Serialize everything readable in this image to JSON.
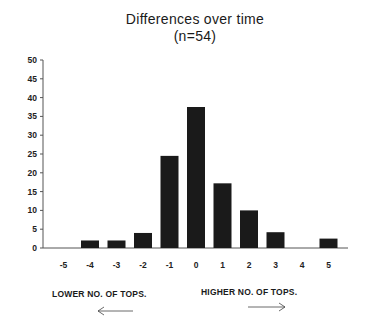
{
  "chart_data": {
    "type": "bar",
    "title": "Differences over time",
    "subtitle": "(n=54)",
    "xlabel": "",
    "ylabel": "",
    "categories": [
      "-5",
      "-4",
      "-3",
      "-2",
      "-1",
      "0",
      "1",
      "2",
      "3",
      "4",
      "5"
    ],
    "values": [
      0,
      2,
      2,
      4,
      24.5,
      37.5,
      17.2,
      10,
      4.2,
      0,
      2.5
    ],
    "ylim": [
      0,
      50
    ],
    "yticks": [
      0,
      5,
      10,
      15,
      20,
      25,
      30,
      35,
      40,
      45,
      50
    ],
    "grid": false,
    "legend": null,
    "bar_color": "#1a1a1a",
    "annotations": [
      {
        "text": "LOWER NO. OF TOPS.",
        "arrow": "left"
      },
      {
        "text": "HIGHER NO. OF TOPS.",
        "arrow": "right"
      }
    ]
  },
  "labels": {
    "title": "Differences over time",
    "subtitle": "(n=54)",
    "lower": "LOWER NO. OF TOPS.",
    "higher": "HIGHER NO. OF TOPS."
  }
}
